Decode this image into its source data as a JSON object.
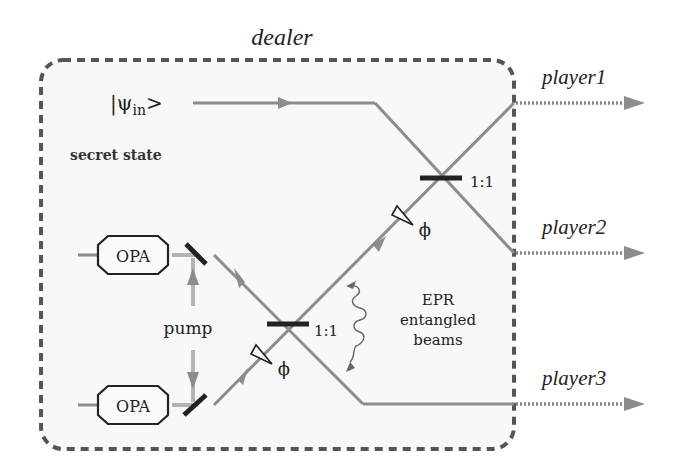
{
  "title": "dealer",
  "input_state": {
    "symbol": "|ψ",
    "subscript": "in",
    "close": ">"
  },
  "secret_state_label": "secret state",
  "opa_top_label": "OPA",
  "opa_bottom_label": "OPA",
  "pump_label": "pump",
  "beam_splitter_top_ratio": "1:1",
  "beam_splitter_bottom_ratio": "1:1",
  "phase_top": "ϕ",
  "phase_bottom": "ϕ",
  "epr": {
    "line1": "EPR",
    "line2": "entangled",
    "line3": "beams"
  },
  "players": [
    {
      "label": "player1"
    },
    {
      "label": "player2"
    },
    {
      "label": "player3"
    }
  ],
  "colors": {
    "beam": "#8c8c8c",
    "pump": "#b3b3b3",
    "dash_border": "#555555",
    "component": "#222222",
    "box_fill": "#f8f8f8"
  }
}
